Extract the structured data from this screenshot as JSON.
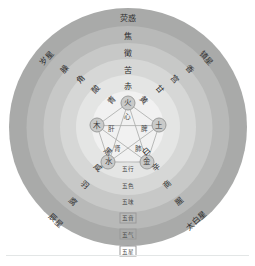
{
  "colors": {
    "ring6": "#a9aaa9",
    "ring5": "#b8b9b8",
    "ring4": "#c7c8c7",
    "ring3": "#d6d7d6",
    "ring2": "#e4e5e4",
    "ring1": "#f1f1f1",
    "node": "#c9cac9",
    "text": "#2e2e2e",
    "background": "#ffffff",
    "rule": "#e3e6e6"
  },
  "center": {
    "elements": [
      {
        "key": "fire",
        "label": "火",
        "organ": "心"
      },
      {
        "key": "earth",
        "label": "土",
        "organ": "脾"
      },
      {
        "key": "metal",
        "label": "金",
        "organ": "肺"
      },
      {
        "key": "water",
        "label": "水",
        "organ": "肾"
      },
      {
        "key": "wood",
        "label": "木",
        "organ": "肝"
      }
    ]
  },
  "ring_names": [
    {
      "key": "wuxing",
      "label": "五行",
      "boxed": false
    },
    {
      "key": "wuse",
      "label": "五色",
      "boxed": false
    },
    {
      "key": "wuwei",
      "label": "五味",
      "boxed": false
    },
    {
      "key": "wuyin",
      "label": "五音",
      "boxed": true
    },
    {
      "key": "wuqi",
      "label": "五气",
      "boxed": true
    },
    {
      "key": "wuxing_star",
      "label": "五星",
      "boxed": true
    }
  ],
  "spokes": [
    {
      "element": "火",
      "direction": "top",
      "color": "赤",
      "taste": "苦",
      "tone": "徵",
      "smell": "焦",
      "planet": "荧惑"
    },
    {
      "element": "土",
      "direction": "upper-right",
      "color": "黄",
      "taste": "甘",
      "tone": "宫",
      "smell": "香",
      "planet": "镇星"
    },
    {
      "element": "金",
      "direction": "lower-right",
      "color": "白",
      "taste": "辛",
      "tone": "商",
      "smell": "腥",
      "planet": "太白星"
    },
    {
      "element": "水",
      "direction": "lower-left",
      "color": "黑",
      "taste": "咸",
      "tone": "羽",
      "smell": "腐",
      "planet": "辰星"
    },
    {
      "element": "木",
      "direction": "upper-left",
      "color": "青",
      "taste": "酸",
      "tone": "角",
      "smell": "臊",
      "planet": "岁星"
    }
  ]
}
